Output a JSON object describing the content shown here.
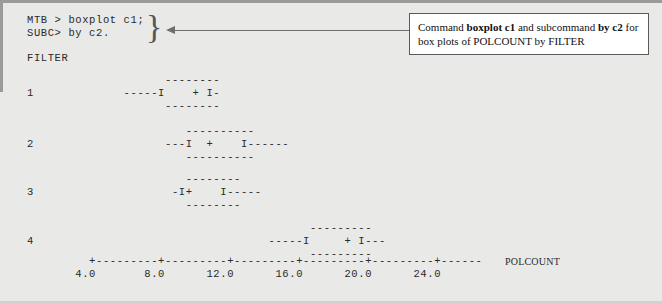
{
  "figure": {
    "background_color": "#e9e9e7",
    "text_color": "#2a2a2a"
  },
  "console": {
    "command_lines": "MTB > boxplot c1;\nSUBC> by c2.",
    "group_brace": "}",
    "variable_header": "FILTER"
  },
  "annotation": {
    "line1_prefix": "Command ",
    "line1_bold1": "boxplot c1",
    "line1_middle": " and subcommand ",
    "line1_bold2": "by c2",
    "line1_suffix": " for",
    "line2": "box plots of POLCOUNT by FILTER",
    "border_color": "#5a5a5a",
    "leader_color": "#6f6f6f"
  },
  "chart_data": {
    "type": "box",
    "title": "",
    "xlabel": "POLCOUNT",
    "ylabel": "FILTER",
    "grid": false,
    "legend": "none",
    "xlim": [
      2.0,
      26.0
    ],
    "xticks": [
      "4.0",
      "8.0",
      "12.0",
      "16.0",
      "20.0",
      "24.0"
    ],
    "xtick_values": [
      4.0,
      8.0,
      12.0,
      16.0,
      20.0,
      24.0
    ],
    "categories": [
      "1",
      "2",
      "3",
      "4"
    ],
    "axis_line": "         +---------+---------+---------+---------+---------+------",
    "tick_label_line": "       4.0       8.0      12.0      16.0      20.0      24.0",
    "series": [
      {
        "name": "1",
        "category": "1",
        "whisker_low": 6.0,
        "q1": 7.6,
        "median": 9.4,
        "q3": 10.7,
        "whisker_high": 11.2,
        "art_top": "                    --------",
        "art_middle": "1             -----I    + I-",
        "art_bottom": "                    --------"
      },
      {
        "name": "2",
        "category": "2",
        "whisker_low": 9.8,
        "q1": 11.1,
        "median": 12.1,
        "q3": 14.6,
        "whisker_high": 16.5,
        "art_top": "                       ----------",
        "art_middle": "2                   ---I  +    I------",
        "art_bottom": "                       ----------"
      },
      {
        "name": "3",
        "category": "3",
        "whisker_low": 10.3,
        "q1": 10.9,
        "median": 11.4,
        "q3": 13.6,
        "whisker_high": 15.1,
        "art_top": "                       --------",
        "art_middle": "3                    -I+    I-----",
        "art_bottom": "                       --------"
      },
      {
        "name": "4",
        "category": "4",
        "whisker_low": 17.9,
        "q1": 19.9,
        "median": 22.2,
        "q3": 23.0,
        "whisker_high": 23.9,
        "art_top": "                                         ---------",
        "art_middle": "4                                  -----I     + I---",
        "art_bottom": "                                         ---------"
      }
    ]
  }
}
